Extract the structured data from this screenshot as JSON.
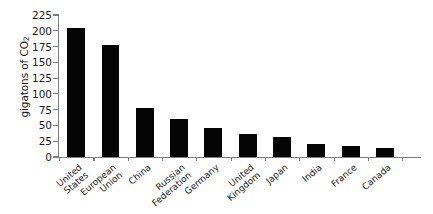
{
  "chart_data": {
    "type": "bar",
    "title": "",
    "subtitle": "",
    "xlabel": "",
    "ylabel": "gigatons of CO",
    "ylabel_subscript": "2",
    "categories": [
      "United States",
      "European Union",
      "China",
      "Russian Federation",
      "Germany",
      "United Kingdom",
      "Japan",
      "India",
      "France",
      "Canada"
    ],
    "category_lines": [
      [
        "United",
        "States"
      ],
      [
        "European",
        "Union"
      ],
      [
        "China"
      ],
      [
        "Russian",
        "Federation"
      ],
      [
        "Germany"
      ],
      [
        "United",
        "Kingdom"
      ],
      [
        "Japan"
      ],
      [
        "India"
      ],
      [
        "France"
      ],
      [
        "Canada"
      ]
    ],
    "values": [
      205,
      178,
      78,
      60,
      46,
      36,
      31,
      20,
      17,
      15
    ],
    "ylim": [
      0,
      225
    ],
    "yticks": [
      0,
      25,
      50,
      75,
      100,
      125,
      150,
      175,
      200,
      225
    ],
    "ytick_labels": [
      "0",
      "25",
      "50",
      "75",
      "100",
      "125",
      "150",
      "175",
      "200",
      "225"
    ],
    "grid": false,
    "legend": false,
    "bar_color": "#050505",
    "axis_color": "#7d7d7d",
    "background_color": "#ffffff"
  }
}
